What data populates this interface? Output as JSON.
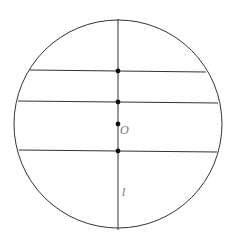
{
  "diagram": {
    "type": "geometry",
    "stroke_color": "#333333",
    "label_color": "#777777",
    "circle": {
      "cx": 118,
      "cy": 124,
      "r": 104
    },
    "line_l": {
      "x": 118,
      "y1": 19,
      "y2": 230
    },
    "chords": [
      {
        "y_left": 70,
        "y_right": 72,
        "x1": 30,
        "x2": 206
      },
      {
        "y_left": 101,
        "y_right": 103,
        "x1": 18,
        "x2": 218
      },
      {
        "y_left": 150,
        "y_right": 152,
        "x1": 19,
        "x2": 217
      }
    ],
    "points": [
      {
        "x": 118,
        "y": 71
      },
      {
        "x": 118,
        "y": 102
      },
      {
        "x": 118,
        "y": 124
      },
      {
        "x": 118,
        "y": 151
      }
    ],
    "labels": {
      "center": "O",
      "line": "l"
    }
  }
}
